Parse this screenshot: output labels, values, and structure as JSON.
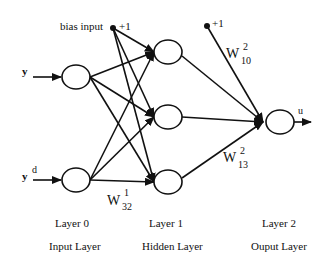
{
  "diagram": {
    "type": "neural-network",
    "inputs": {
      "y": "y",
      "yd_base": "y",
      "yd_sup": "d",
      "bias_label": "bias input",
      "bias_value": "+1"
    },
    "output": {
      "bias_value": "+1",
      "label": "u"
    },
    "weights": {
      "w10": {
        "base": "W",
        "sup": "2",
        "sub": "10"
      },
      "w13": {
        "base": "W",
        "sup": "2",
        "sub": "13"
      },
      "w32": {
        "base": "W",
        "sup": "1",
        "sub": "32"
      }
    },
    "layers": [
      {
        "name": "Layer  0",
        "desc": "Input  Layer"
      },
      {
        "name": "Layer  1",
        "desc": "Hidden Layer"
      },
      {
        "name": "Layer  2",
        "desc": "Ouput  Layer"
      }
    ]
  }
}
